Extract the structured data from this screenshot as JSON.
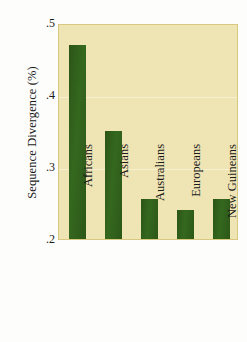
{
  "chart_data": {
    "type": "bar",
    "title": "",
    "xlabel": "",
    "ylabel": "Sequence Divergence (%)",
    "categories": [
      "Africans",
      "Asians",
      "Australians",
      "Europeans",
      "New Guineans"
    ],
    "values": [
      0.47,
      0.35,
      0.255,
      0.24,
      0.255
    ],
    "ylim": [
      0.2,
      0.5
    ],
    "ytick_labels": [
      ".5",
      ".4",
      ".3",
      ".2"
    ],
    "ytick_values": [
      0.5,
      0.4,
      0.3,
      0.2
    ],
    "grid": true,
    "gridlines_at": [
      0.4,
      0.3
    ],
    "legend": null,
    "legend_position": "none",
    "colors": {
      "bar": "#2f5d1b",
      "plot_background": "#efe5b4",
      "plot_border": "#d9c97f",
      "gridline": "#f7f0cf",
      "text": "#1a1a1a",
      "figure_background": "#fdfdfb"
    }
  },
  "axis": {
    "y_title": "Sequence Divergence (%)"
  }
}
